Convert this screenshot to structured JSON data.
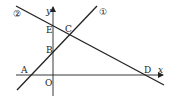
{
  "diagram": {
    "type": "coordinate-geometry",
    "axes": {
      "x_label": "x",
      "y_label": "y",
      "origin_label": "O"
    },
    "lines": [
      {
        "id": "line1",
        "label": "①",
        "passes_through": [
          "A",
          "B",
          "C"
        ]
      },
      {
        "id": "line2",
        "label": "②",
        "passes_through": [
          "E",
          "C",
          "D"
        ]
      }
    ],
    "points": {
      "A": "A",
      "B": "B",
      "C": "C",
      "D": "D",
      "E": "E",
      "O": "O"
    }
  }
}
